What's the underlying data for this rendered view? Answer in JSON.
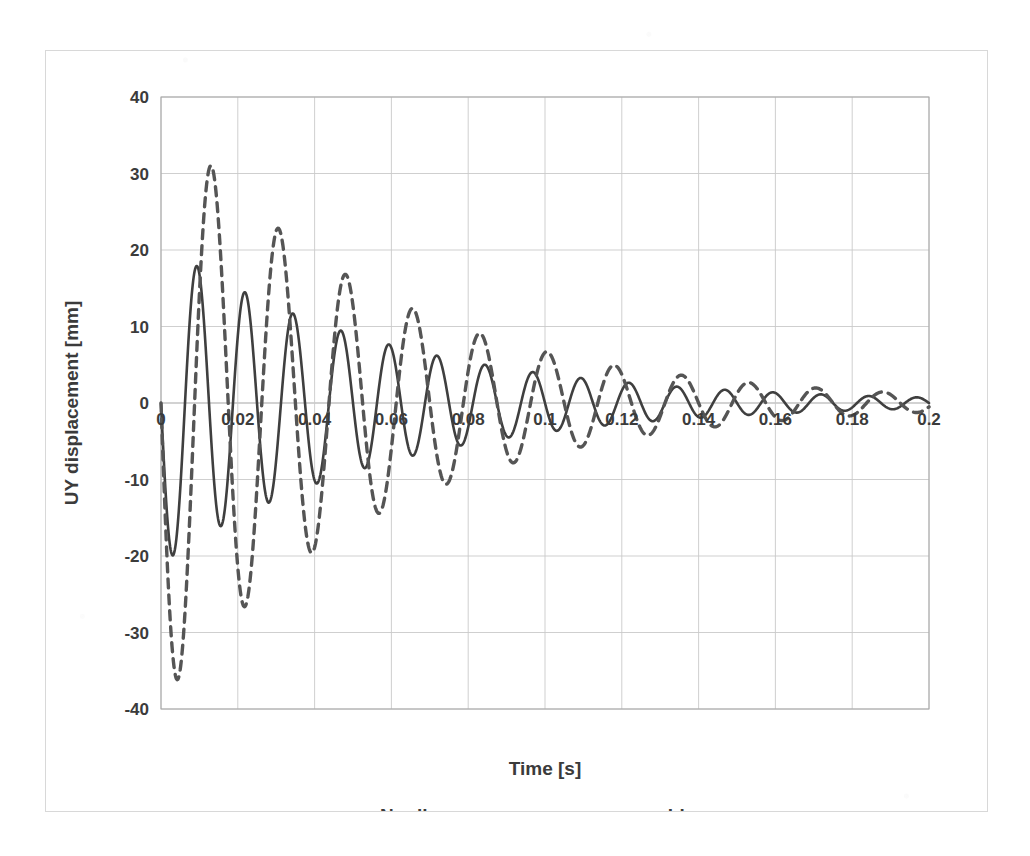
{
  "chart_data": {
    "type": "line",
    "title": "",
    "xlabel": "Time [s]",
    "ylabel": "UY displacement [mm]",
    "xlim": [
      0,
      0.2
    ],
    "ylim": [
      -40,
      40
    ],
    "xticks": [
      "0",
      "0.02",
      "0.04",
      "0.06",
      "0.08",
      "0.1",
      "0.12",
      "0.14",
      "0.16",
      "0.18",
      "0.2"
    ],
    "xtick_values": [
      0,
      0.02,
      0.04,
      0.06,
      0.08,
      0.1,
      0.12,
      0.14,
      0.16,
      0.18,
      0.2
    ],
    "yticks": [
      "40",
      "30",
      "20",
      "10",
      "0",
      "-10",
      "-20",
      "-30",
      "-40"
    ],
    "ytick_values": [
      40,
      30,
      20,
      10,
      0,
      -10,
      -20,
      -30,
      -40
    ],
    "grid": true,
    "grid_color": "#c8c8c8",
    "legend_position": "bottom",
    "series": [
      {
        "name": "Nonlinear response",
        "style": "solid",
        "color": "#3f3f3f",
        "model": {
          "kind": "damped-sine",
          "amplitude": 21.0,
          "decay_rate": 17.0,
          "period": 0.0125,
          "phase_shift": 0.0,
          "sign": -1
        },
        "key_points": [
          {
            "t": 0.0,
            "y": 0.0
          },
          {
            "t": 0.006,
            "y": -19.5
          },
          {
            "t": 0.0125,
            "y": 13.0
          },
          {
            "t": 0.019,
            "y": -11.5
          },
          {
            "t": 0.025,
            "y": 10.0
          },
          {
            "t": 0.031,
            "y": -9.0
          },
          {
            "t": 0.0375,
            "y": 8.3
          },
          {
            "t": 0.044,
            "y": -7.3
          },
          {
            "t": 0.05,
            "y": 6.6
          },
          {
            "t": 0.056,
            "y": -6.0
          },
          {
            "t": 0.0625,
            "y": 5.6
          },
          {
            "t": 0.069,
            "y": -5.0
          },
          {
            "t": 0.075,
            "y": 4.7
          },
          {
            "t": 0.081,
            "y": -4.2
          },
          {
            "t": 0.0875,
            "y": 4.0
          },
          {
            "t": 0.094,
            "y": -3.5
          },
          {
            "t": 0.1,
            "y": 3.4
          },
          {
            "t": 0.106,
            "y": -3.0
          },
          {
            "t": 0.1125,
            "y": 2.8
          },
          {
            "t": 0.119,
            "y": -2.5
          },
          {
            "t": 0.125,
            "y": 2.4
          },
          {
            "t": 0.131,
            "y": -2.1
          },
          {
            "t": 0.1375,
            "y": 2.0
          },
          {
            "t": 0.144,
            "y": -1.8
          },
          {
            "t": 0.15,
            "y": 1.7
          },
          {
            "t": 0.156,
            "y": -1.5
          },
          {
            "t": 0.1625,
            "y": 1.4
          },
          {
            "t": 0.169,
            "y": -1.2
          },
          {
            "t": 0.175,
            "y": 1.2
          },
          {
            "t": 0.181,
            "y": -1.0
          },
          {
            "t": 0.1875,
            "y": 1.0
          },
          {
            "t": 0.194,
            "y": -0.8
          },
          {
            "t": 0.2,
            "y": 0.8
          }
        ]
      },
      {
        "name": "Linear response",
        "style": "dashed",
        "color": "#555555",
        "model": {
          "kind": "damped-sine",
          "amplitude": 39.0,
          "decay_rate": 17.5,
          "period": 0.0175,
          "phase_shift": 0.0,
          "sign": -1
        },
        "key_points": [
          {
            "t": 0.0,
            "y": 0.0
          },
          {
            "t": 0.0085,
            "y": -35.0
          },
          {
            "t": 0.0175,
            "y": 29.5
          },
          {
            "t": 0.0262,
            "y": -25.2
          },
          {
            "t": 0.035,
            "y": 21.5
          },
          {
            "t": 0.0437,
            "y": -18.3
          },
          {
            "t": 0.0525,
            "y": 15.7
          },
          {
            "t": 0.0612,
            "y": -13.8
          },
          {
            "t": 0.07,
            "y": 12.0
          },
          {
            "t": 0.0787,
            "y": -10.2
          },
          {
            "t": 0.0875,
            "y": 8.6
          },
          {
            "t": 0.0962,
            "y": -7.5
          },
          {
            "t": 0.105,
            "y": 6.6
          },
          {
            "t": 0.1137,
            "y": -5.7
          },
          {
            "t": 0.1225,
            "y": 5.0
          },
          {
            "t": 0.1312,
            "y": -4.3
          },
          {
            "t": 0.14,
            "y": 3.8
          },
          {
            "t": 0.1487,
            "y": -3.3
          },
          {
            "t": 0.1575,
            "y": 2.9
          },
          {
            "t": 0.1662,
            "y": -2.5
          },
          {
            "t": 0.175,
            "y": 2.2
          },
          {
            "t": 0.1837,
            "y": -1.9
          },
          {
            "t": 0.1925,
            "y": 1.7
          },
          {
            "t": 0.2,
            "y": -1.2
          }
        ]
      }
    ],
    "legend": [
      {
        "label": "Nonlinear response",
        "style": "solid"
      },
      {
        "label": "Linear response",
        "style": "dashed"
      }
    ]
  },
  "style": {
    "axis_color": "#a6a6a6",
    "grid_color": "#c9c9c9",
    "text_color": "#3b3b3b",
    "frame_color": "#d8d8d8",
    "background": "#ffffff"
  }
}
